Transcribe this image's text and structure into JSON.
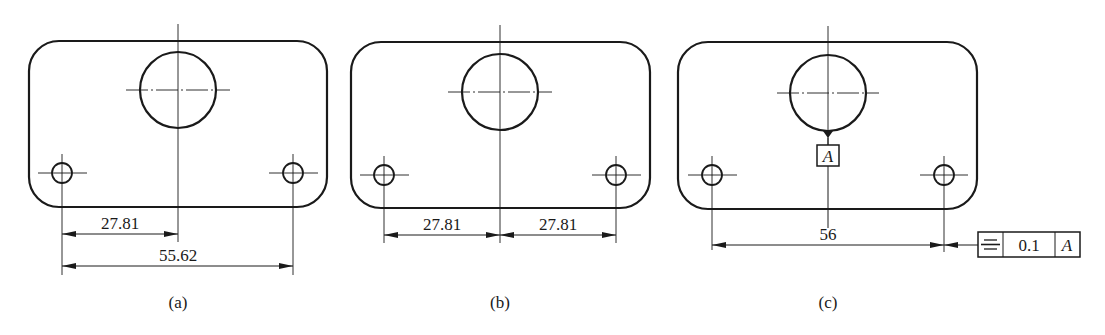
{
  "figure": {
    "panels": [
      {
        "id": "a",
        "caption": "(a)",
        "dimensions": [
          {
            "label": "27.81",
            "from": "left-hole-axis",
            "to": "center-hole-axis"
          },
          {
            "label": "55.62",
            "from": "left-hole-axis",
            "to": "right-hole-axis"
          }
        ]
      },
      {
        "id": "b",
        "caption": "(b)",
        "dimensions": [
          {
            "label": "27.81",
            "from": "left-hole-axis",
            "to": "center-hole-axis"
          },
          {
            "label": "27.81",
            "from": "center-hole-axis",
            "to": "right-hole-axis"
          }
        ]
      },
      {
        "id": "c",
        "caption": "(c)",
        "dimensions": [
          {
            "label": "56",
            "from": "left-hole-axis",
            "to": "right-hole-axis"
          }
        ],
        "datum": {
          "label": "A"
        },
        "feature_control_frame": {
          "symbol": "symmetry-icon",
          "tolerance": "0.1",
          "datum": "A"
        }
      }
    ]
  },
  "colors": {
    "line": "#1a1a1a",
    "background": "#ffffff"
  }
}
